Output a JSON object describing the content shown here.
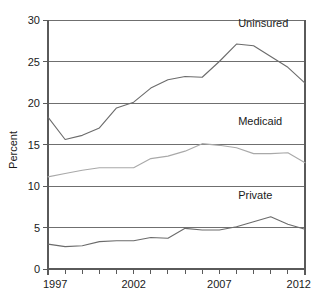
{
  "chart_data": {
    "type": "line",
    "title": "",
    "subtitle": "",
    "xlabel": "",
    "ylabel": "Percent",
    "xlim": [
      1997,
      2012
    ],
    "ylim": [
      0,
      30
    ],
    "ytick_values": [
      0,
      5,
      10,
      15,
      20,
      25,
      30
    ],
    "ytick_labels": [
      "0",
      "5",
      "10",
      "15",
      "20",
      "25",
      "30"
    ],
    "xtick_values": [
      1997,
      1998,
      1999,
      2000,
      2001,
      2002,
      2003,
      2004,
      2005,
      2006,
      2007,
      2008,
      2009,
      2010,
      2011,
      2012
    ],
    "xtick_labels_shown": [
      "1997",
      "2002",
      "2007",
      "2012"
    ],
    "xtick_labeled_values": [
      1997,
      2002,
      2007,
      2012
    ],
    "grid": "horizontal",
    "legend": "inline-series-labels",
    "x": [
      1997,
      1998,
      1999,
      2000,
      2001,
      2002,
      2003,
      2004,
      2005,
      2006,
      2007,
      2008,
      2009,
      2010,
      2011,
      2012
    ],
    "series": [
      {
        "name": "Uninsured",
        "color": "#6b6b6b",
        "values": [
          18.3,
          15.6,
          16.1,
          17.0,
          19.4,
          20.1,
          21.8,
          22.8,
          23.2,
          23.1,
          25.0,
          27.1,
          26.9,
          25.6,
          24.3,
          22.4
        ],
        "label_x": 2008.1,
        "label_y": 29.1
      },
      {
        "name": "Medicaid",
        "color": "#a9a9a9",
        "values": [
          11.1,
          11.5,
          11.9,
          12.2,
          12.2,
          12.2,
          13.3,
          13.6,
          14.2,
          15.1,
          14.9,
          14.6,
          13.9,
          13.9,
          14.0,
          12.8
        ],
        "label_x": 2008.1,
        "label_y": 17.4
      },
      {
        "name": "Private",
        "color": "#6b6b6b",
        "values": [
          3.0,
          2.7,
          2.8,
          3.3,
          3.4,
          3.4,
          3.8,
          3.7,
          4.9,
          4.7,
          4.7,
          5.1,
          5.7,
          6.3,
          5.4,
          4.8
        ],
        "label_x": 2008.1,
        "label_y": 8.4
      }
    ]
  },
  "axes": {
    "y_title": "Percent"
  }
}
